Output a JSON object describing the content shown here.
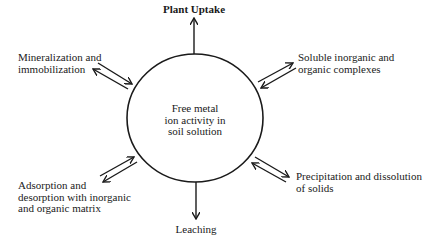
{
  "diagram": {
    "center": {
      "lines": [
        "Free metal",
        "ion activity in",
        "soil solution"
      ]
    },
    "top": {
      "label": "Plant Uptake",
      "direction": "out"
    },
    "bottom": {
      "label": "Leaching",
      "direction": "out"
    },
    "upper_left": {
      "lines": [
        "Mineralization and",
        "immobilization"
      ],
      "direction": "bidirectional"
    },
    "upper_right": {
      "lines": [
        "Soluble inorganic and",
        "organic complexes"
      ],
      "direction": "bidirectional"
    },
    "lower_left": {
      "lines": [
        "Adsorption and",
        "desorption with inorganic",
        "and organic matrix"
      ],
      "direction": "bidirectional"
    },
    "lower_right": {
      "lines": [
        "Precipitation and dissolution",
        "of solids"
      ],
      "direction": "bidirectional"
    },
    "colors": {
      "stroke": "#1a1a1a",
      "background": "#ffffff"
    }
  }
}
